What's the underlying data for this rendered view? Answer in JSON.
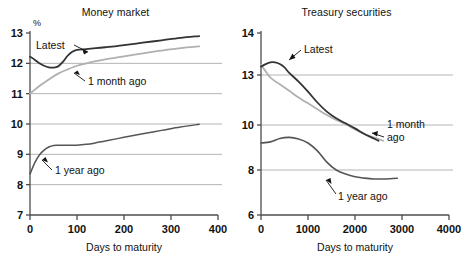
{
  "figure": {
    "background": "#ffffff",
    "axis_color": "#4d4d4d",
    "grid_color": "#b4b4b4"
  },
  "panels": {
    "left": {
      "title": "Money market",
      "y_unit": "%",
      "xlabel": "Days to maturity",
      "xticks": [
        "0",
        "100",
        "200",
        "300",
        "400"
      ],
      "yticks": [
        "7",
        "8",
        "9",
        "10",
        "11",
        "12",
        "13"
      ],
      "annotations": {
        "latest": "Latest",
        "month": "1 month ago",
        "year": "1 year ago"
      }
    },
    "right": {
      "title": "Treasury securities",
      "xlabel": "Days to maturity",
      "xticks": [
        "0",
        "1000",
        "2000",
        "3000",
        "4000"
      ],
      "yticks": [
        "6",
        "8",
        "10",
        "13",
        "14"
      ],
      "annotations": {
        "latest": "Latest",
        "month_line1": "1 month",
        "month_line2": "ago",
        "year": "1 year ago"
      }
    }
  },
  "chart_data": [
    {
      "type": "line",
      "title": "Money market",
      "xlabel": "Days to maturity",
      "ylabel": "%",
      "xlim": [
        0,
        400
      ],
      "ylim": [
        7,
        13
      ],
      "xticks": [
        0,
        100,
        200,
        300,
        400
      ],
      "yticks": [
        7,
        8,
        9,
        10,
        11,
        12,
        13
      ],
      "grid": "horizontal",
      "gridlines_at": [
        8,
        9,
        10,
        11,
        12
      ],
      "legend": "inline-annotations",
      "series": [
        {
          "name": "Latest",
          "color": "#333333",
          "width": 1.8,
          "x": [
            0,
            10,
            20,
            30,
            40,
            50,
            60,
            70,
            80,
            90,
            100,
            120,
            140,
            160,
            180,
            200,
            240,
            280,
            320,
            360
          ],
          "y": [
            12.22,
            12.12,
            12.0,
            11.92,
            11.87,
            11.86,
            11.9,
            12.05,
            12.25,
            12.38,
            12.44,
            12.47,
            12.5,
            12.53,
            12.56,
            12.6,
            12.68,
            12.76,
            12.84,
            12.9
          ]
        },
        {
          "name": "1 month ago",
          "color": "#b0b0b0",
          "width": 1.8,
          "x": [
            0,
            20,
            40,
            60,
            80,
            100,
            120,
            140,
            160,
            180,
            200,
            240,
            280,
            320,
            360
          ],
          "y": [
            11.0,
            11.25,
            11.47,
            11.66,
            11.8,
            11.92,
            12.0,
            12.07,
            12.13,
            12.18,
            12.23,
            12.33,
            12.42,
            12.5,
            12.56
          ]
        },
        {
          "name": "1 year ago",
          "color": "#555555",
          "width": 1.5,
          "x": [
            0,
            10,
            20,
            30,
            40,
            50,
            60,
            80,
            100,
            120,
            140,
            160,
            200,
            240,
            280,
            320,
            360
          ],
          "y": [
            8.35,
            8.72,
            8.98,
            9.14,
            9.24,
            9.29,
            9.3,
            9.3,
            9.3,
            9.33,
            9.38,
            9.44,
            9.56,
            9.68,
            9.79,
            9.9,
            9.99
          ]
        }
      ]
    },
    {
      "type": "line",
      "title": "Treasury securities",
      "xlabel": "Days to maturity",
      "ylabel": "",
      "xlim": [
        0,
        4000
      ],
      "ylim": [
        6,
        14
      ],
      "xticks": [
        0,
        1000,
        2000,
        3000,
        4000
      ],
      "yticks": [
        6,
        8,
        10,
        13,
        14
      ],
      "yaxis_note": "non-uniform labelled ticks (compressed between 10 and 14)",
      "grid": "horizontal",
      "gridlines_at": [
        8,
        10,
        13
      ],
      "legend": "inline-annotations",
      "series": [
        {
          "name": "Latest",
          "color": "#333333",
          "width": 1.8,
          "x": [
            0,
            100,
            200,
            300,
            400,
            500,
            600,
            800,
            1000,
            1200,
            1400,
            1600,
            1800,
            2000,
            2200,
            2400,
            2500
          ],
          "y": [
            13.2,
            13.26,
            13.3,
            13.3,
            13.26,
            13.18,
            13.05,
            12.6,
            12.0,
            11.35,
            10.8,
            10.4,
            10.1,
            9.85,
            9.6,
            9.4,
            9.3
          ]
        },
        {
          "name": "1 month ago",
          "color": "#b0b0b0",
          "width": 1.8,
          "x": [
            0,
            200,
            400,
            600,
            800,
            1000,
            1200,
            1400,
            1600,
            1800,
            2000,
            2200,
            2400,
            2600
          ],
          "y": [
            13.25,
            12.85,
            12.45,
            12.05,
            11.65,
            11.3,
            10.95,
            10.6,
            10.3,
            10.05,
            9.8,
            9.6,
            9.45,
            9.3
          ]
        },
        {
          "name": "1 year ago",
          "color": "#555555",
          "width": 1.6,
          "x": [
            0,
            200,
            400,
            600,
            800,
            1000,
            1200,
            1400,
            1600,
            1800,
            2000,
            2200,
            2400,
            2600,
            2800,
            2900
          ],
          "y": [
            9.2,
            9.25,
            9.4,
            9.45,
            9.38,
            9.2,
            8.85,
            8.35,
            8.0,
            7.82,
            7.7,
            7.64,
            7.6,
            7.6,
            7.62,
            7.63
          ]
        }
      ]
    }
  ]
}
